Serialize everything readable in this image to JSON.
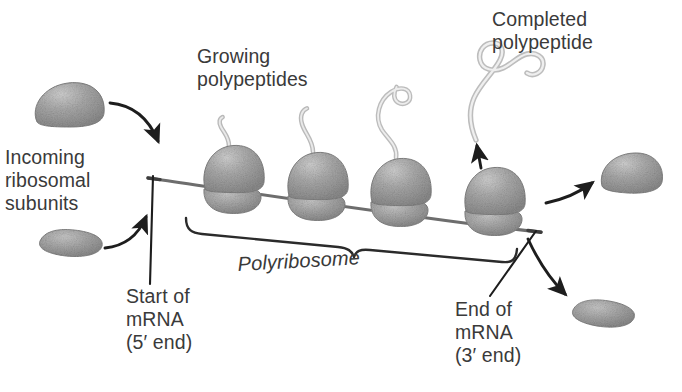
{
  "figure": {
    "background_color": "#ffffff",
    "text_color": "#3a3a3a",
    "ink_color": "#2b2b2b",
    "ribosome_fill": "#9a9a9a",
    "polypeptide_fill": "#d8d8d8"
  },
  "labels": {
    "incoming_subunits": "Incoming\nribosomal\nsubunits",
    "growing_polypeptides": "Growing\npolypeptides",
    "completed_polypeptide": "Completed\npolypeptide",
    "polyribosome": "Polyribosome",
    "start_of_mrna": "Start of\nmRNA\n(5′ end)",
    "end_of_mrna": "End of\nmRNA\n(3′ end)"
  },
  "structures": {
    "mrna_strand": "mRNA strand",
    "ribosome_count": 4,
    "ribosomes": [
      {
        "id": 1,
        "x": 232,
        "y": 185,
        "polypeptide_length": "short"
      },
      {
        "id": 2,
        "x": 316,
        "y": 190,
        "polypeptide_length": "medium"
      },
      {
        "id": 3,
        "x": 398,
        "y": 196,
        "polypeptide_length": "long"
      },
      {
        "id": 4,
        "x": 492,
        "y": 205,
        "polypeptide_length": "released"
      }
    ],
    "incoming_large_subunit": "large ribosomal subunit approaching mRNA",
    "incoming_small_subunit": "small ribosomal subunit approaching mRNA",
    "departing_large_subunit": "large ribosomal subunit leaving mRNA",
    "departing_small_subunit": "small ribosomal subunit leaving mRNA",
    "polyribosome_bracket": "brace spanning all four ribosomes"
  },
  "icons": {
    "arrow_incoming_large": "curved-arrow-icon",
    "arrow_incoming_small": "curved-arrow-icon",
    "arrow_release_polypeptide": "up-arrow-icon",
    "arrow_departing_large": "curved-arrow-icon",
    "arrow_departing_small": "curved-arrow-icon",
    "leader_start_mrna": "leader-line-icon",
    "leader_end_mrna": "leader-line-icon"
  }
}
